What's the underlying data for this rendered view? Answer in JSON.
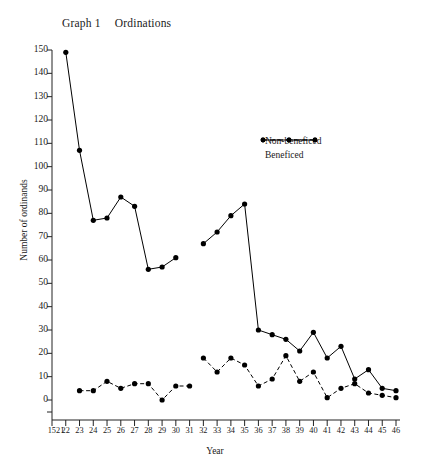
{
  "chart_data": {
    "type": "line",
    "title": "Graph 1",
    "subtitle": "Ordinations",
    "xlabel": "Year",
    "ylabel": "Number of ordinands",
    "ylim": [
      0,
      150
    ],
    "ytick_step": 10,
    "yticks": [
      0,
      10,
      20,
      30,
      40,
      50,
      60,
      70,
      80,
      90,
      100,
      110,
      120,
      130,
      140,
      150
    ],
    "xlim": [
      1521,
      1546
    ],
    "x": [
      1521,
      1522,
      1523,
      1524,
      1525,
      1526,
      1527,
      1528,
      1529,
      1530,
      1531,
      1532,
      1533,
      1534,
      1535,
      1536,
      1537,
      1538,
      1539,
      1540,
      1541,
      1542,
      1543,
      1544,
      1545,
      1546
    ],
    "xtick_labels": [
      "1521",
      "22",
      "23",
      "24",
      "25",
      "26",
      "27",
      "28",
      "29",
      "30",
      "31",
      "32",
      "33",
      "34",
      "35",
      "36",
      "37",
      "38",
      "39",
      "40",
      "41",
      "42",
      "43",
      "44",
      "45",
      "46"
    ],
    "grid": false,
    "legend_position": "upper-right",
    "series": [
      {
        "name": "Non-beneficed",
        "style": "solid",
        "marker": "filled-circle",
        "color": "#000000",
        "points": [
          {
            "x": 1522,
            "y": 149
          },
          {
            "x": 1523,
            "y": 107
          },
          {
            "x": 1524,
            "y": 77
          },
          {
            "x": 1525,
            "y": 78
          },
          {
            "x": 1526,
            "y": 87
          },
          {
            "x": 1527,
            "y": 83
          },
          {
            "x": 1528,
            "y": 56
          },
          {
            "x": 1529,
            "y": 57
          },
          {
            "x": 1530,
            "y": 61
          },
          {
            "x": 1532,
            "y": 67
          },
          {
            "x": 1533,
            "y": 72
          },
          {
            "x": 1534,
            "y": 79
          },
          {
            "x": 1535,
            "y": 84
          },
          {
            "x": 1536,
            "y": 30
          },
          {
            "x": 1537,
            "y": 28
          },
          {
            "x": 1538,
            "y": 26
          },
          {
            "x": 1539,
            "y": 21
          },
          {
            "x": 1540,
            "y": 29
          },
          {
            "x": 1541,
            "y": 18
          },
          {
            "x": 1542,
            "y": 23
          },
          {
            "x": 1543,
            "y": 9
          },
          {
            "x": 1544,
            "y": 13
          },
          {
            "x": 1545,
            "y": 5
          },
          {
            "x": 1546,
            "y": 4
          }
        ],
        "breaks_after_x": [
          1530
        ]
      },
      {
        "name": "Beneficed",
        "style": "dashed",
        "marker": "filled-circle",
        "color": "#000000",
        "points": [
          {
            "x": 1523,
            "y": 4
          },
          {
            "x": 1524,
            "y": 4
          },
          {
            "x": 1525,
            "y": 8
          },
          {
            "x": 1526,
            "y": 5
          },
          {
            "x": 1527,
            "y": 7
          },
          {
            "x": 1528,
            "y": 7
          },
          {
            "x": 1529,
            "y": 0
          },
          {
            "x": 1530,
            "y": 6
          },
          {
            "x": 1531,
            "y": 6
          },
          {
            "x": 1532,
            "y": 18
          },
          {
            "x": 1533,
            "y": 12
          },
          {
            "x": 1534,
            "y": 18
          },
          {
            "x": 1535,
            "y": 15
          },
          {
            "x": 1536,
            "y": 6
          },
          {
            "x": 1537,
            "y": 9
          },
          {
            "x": 1538,
            "y": 19
          },
          {
            "x": 1539,
            "y": 8
          },
          {
            "x": 1540,
            "y": 12
          },
          {
            "x": 1541,
            "y": 1
          },
          {
            "x": 1542,
            "y": 5
          },
          {
            "x": 1543,
            "y": 7
          },
          {
            "x": 1544,
            "y": 3
          },
          {
            "x": 1545,
            "y": 2
          },
          {
            "x": 1546,
            "y": 1
          }
        ],
        "breaks_after_x": [
          1531
        ]
      }
    ]
  }
}
